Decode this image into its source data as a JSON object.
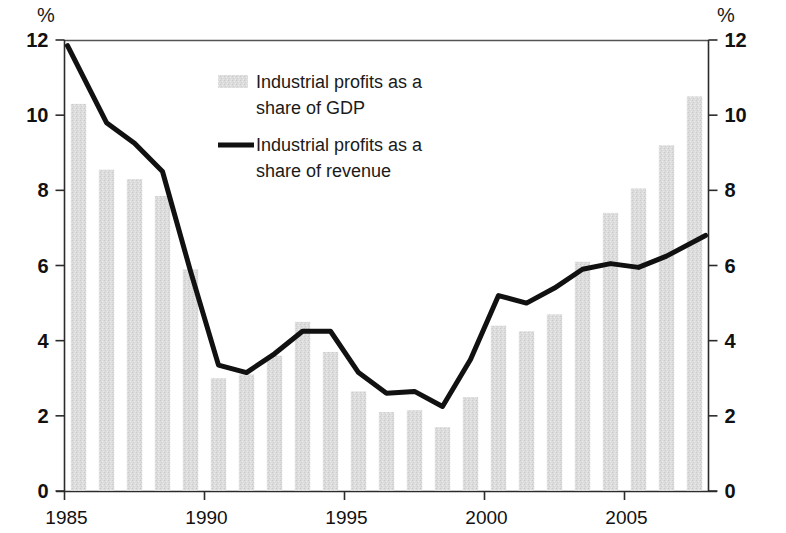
{
  "axes": {
    "left_unit": "%",
    "right_unit": "%",
    "y_ticks": [
      "0",
      "2",
      "4",
      "6",
      "8",
      "10",
      "12"
    ],
    "x_ticks": [
      "1985",
      "1990",
      "1995",
      "2000",
      "2005"
    ]
  },
  "legend": {
    "items": [
      {
        "marker": "bar-swatch",
        "line1": "Industrial profits as a",
        "line2": "share of GDP"
      },
      {
        "marker": "line-swatch",
        "line1": "Industrial profits as a",
        "line2": "share of revenue"
      }
    ]
  },
  "colors": {
    "bar_fill": "#d9d9d9",
    "line_stroke": "#111111",
    "axis": "#2b2b2b",
    "background": "#ffffff"
  },
  "chart_data": {
    "type": "bar",
    "title": "",
    "subtitle": "",
    "xlabel": "",
    "ylabel": "%",
    "ylim": [
      0,
      12
    ],
    "ytick_values": [
      0,
      2,
      4,
      6,
      8,
      10,
      12
    ],
    "xtick_values": [
      1985,
      1990,
      1995,
      2000,
      2005
    ],
    "grid": false,
    "legend_position": "upper-center",
    "categories": [
      1985,
      1986,
      1987,
      1988,
      1989,
      1990,
      1991,
      1992,
      1993,
      1994,
      1995,
      1996,
      1997,
      1998,
      1999,
      2000,
      2001,
      2002,
      2003,
      2004,
      2005,
      2006,
      2007
    ],
    "series": [
      {
        "name": "Industrial profits as a share of GDP",
        "type": "bar",
        "values": [
          10.3,
          8.55,
          8.3,
          7.85,
          5.9,
          3.0,
          3.1,
          3.6,
          4.5,
          3.7,
          2.65,
          2.1,
          2.15,
          1.7,
          2.5,
          4.4,
          4.25,
          4.7,
          6.1,
          7.4,
          8.05,
          9.2,
          10.5
        ]
      },
      {
        "name": "Industrial profits as a share of revenue",
        "type": "line",
        "values": [
          11.85,
          9.8,
          9.25,
          8.5,
          5.85,
          3.35,
          3.15,
          3.65,
          4.25,
          4.25,
          3.15,
          2.6,
          2.65,
          2.25,
          3.5,
          5.2,
          5.0,
          5.4,
          5.9,
          6.05,
          5.95,
          6.25,
          6.8
        ]
      }
    ]
  }
}
